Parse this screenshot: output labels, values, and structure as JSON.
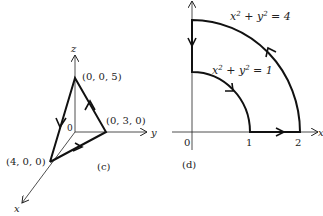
{
  "panel_c": {
    "caption": "(c)",
    "axes": {
      "x": "x",
      "y": "y",
      "z": "z",
      "origin": "0"
    },
    "points": {
      "z_point": "(0, 0, 5)",
      "y_point": "(0, 3, 0)",
      "x_point": "(4, 0, 0)"
    },
    "path": "closed triangle (4,0,0) → (0,3,0) → (0,0,5) → (4,0,0)"
  },
  "panel_d": {
    "caption": "(d)",
    "axes": {
      "x": "x",
      "origin": "0"
    },
    "ticks": [
      "1",
      "2"
    ],
    "curves": {
      "outer": "x² + y² = 4",
      "inner": "x² + y² = 1"
    },
    "path": "region between quarter circles r=1 and r=2 in first quadrant, traversed counterclockwise on outer arc"
  },
  "colors": {
    "ink": "#222222",
    "background": "#ffffff"
  }
}
